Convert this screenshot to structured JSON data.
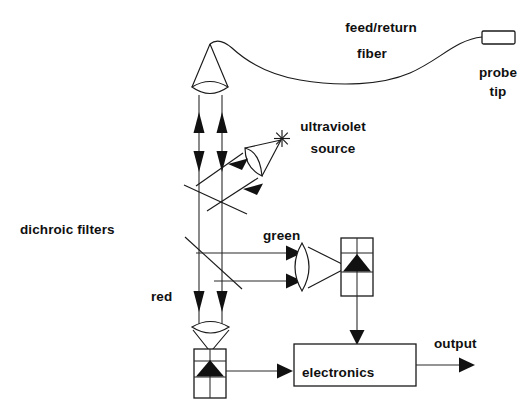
{
  "figure": {
    "type": "optical-schematic",
    "background_color": "#ffffff",
    "line_color": "#1a1a1a",
    "text_color": "#101010"
  },
  "labels": {
    "feed_return_fiber_line1": "feed/return",
    "feed_return_fiber_line2": "fiber",
    "probe_tip_line1": "probe",
    "probe_tip_line2": "tip",
    "ultraviolet_source_line1": "ultraviolet",
    "ultraviolet_source_line2": "source",
    "dichroic_filters": "dichroic filters",
    "green": "green",
    "red": "red",
    "electronics": "electronics",
    "output": "output"
  },
  "components": [
    {
      "name": "probe-tip",
      "shape": "rectangle",
      "label": "probe tip"
    },
    {
      "name": "feed-return-fiber",
      "shape": "curve",
      "label": "feed/return fiber"
    },
    {
      "name": "collimating-lens",
      "shape": "biconvex-lens"
    },
    {
      "name": "upper-dichroic-filter",
      "shape": "diagonal-line",
      "label": "dichroic filters"
    },
    {
      "name": "lower-dichroic-filter",
      "shape": "diagonal-line",
      "label": "dichroic filters"
    },
    {
      "name": "ultraviolet-source",
      "shape": "star-emitter",
      "label": "ultraviolet source"
    },
    {
      "name": "uv-condenser-lens",
      "shape": "biconvex-lens"
    },
    {
      "name": "green-focusing-lens",
      "shape": "biconvex-lens"
    },
    {
      "name": "green-detector",
      "shape": "detector-box",
      "label": "green"
    },
    {
      "name": "red-focusing-lens",
      "shape": "biconvex-lens"
    },
    {
      "name": "red-detector",
      "shape": "detector-box",
      "label": "red"
    },
    {
      "name": "electronics-box",
      "shape": "rectangle",
      "label": "electronics"
    },
    {
      "name": "output-arrow",
      "shape": "arrow",
      "label": "output"
    }
  ],
  "beams": [
    {
      "name": "up-beam-left",
      "direction": "up"
    },
    {
      "name": "up-beam-right",
      "direction": "up"
    },
    {
      "name": "down-beam-left",
      "direction": "down"
    },
    {
      "name": "down-beam-right",
      "direction": "down"
    },
    {
      "name": "uv-injection-beam",
      "direction": "down-left"
    },
    {
      "name": "green-beam-upper",
      "direction": "right"
    },
    {
      "name": "green-beam-lower",
      "direction": "right"
    },
    {
      "name": "green-detector-signal",
      "direction": "down"
    },
    {
      "name": "red-detector-signal",
      "direction": "right"
    },
    {
      "name": "electronics-output",
      "direction": "right"
    }
  ]
}
